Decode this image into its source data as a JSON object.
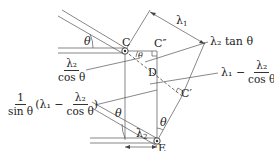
{
  "diagram": {
    "type": "geometry-diagram",
    "points": {
      "C": "C",
      "C_double_prime": "C″",
      "C_prime": "C′",
      "D": "D",
      "E": "E"
    },
    "angle_labels": {
      "top_left": "θ",
      "at_C": "θ",
      "at_E_left": "θ",
      "at_E_right": "θ"
    },
    "dimension_labels": {
      "lambda1_top": "λ",
      "lambda1_sub": "1",
      "lambda2_bottom": "λ",
      "lambda2_sub": "2"
    },
    "annotations": {
      "lambda2_over_cos": {
        "num": "λ₂",
        "den": "cos θ"
      },
      "lambda2_tan": {
        "text": "λ₂ tan θ"
      },
      "lambda1_minus": {
        "prefix": "λ₁ −",
        "num": "λ₂",
        "den": "cos θ"
      },
      "left_expr": {
        "outer_num": "1",
        "outer_den": "sin θ",
        "inner_prefix": "(λ₁ −",
        "inner_num": "λ₂",
        "inner_den": "cos θ",
        "inner_suffix": ")"
      }
    },
    "colors": {
      "line": "#444444",
      "dashed": "#444444",
      "background": "#ffffff"
    }
  }
}
